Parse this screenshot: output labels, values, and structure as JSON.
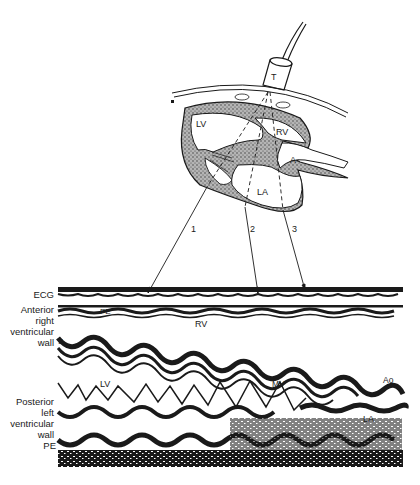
{
  "figure": {
    "type": "echocardiogram-sweep-illustration",
    "diagram": {
      "transducer_label": "T",
      "chambers": {
        "lv": "LV",
        "rv": "RV",
        "la": "LA",
        "aorta": "A"
      },
      "beam_numbers": [
        "1",
        "2",
        "3"
      ]
    },
    "mmode": {
      "left_labels": {
        "ecg": "ECG",
        "anterior_rv_wall": [
          "Anterior",
          "right",
          "ventricular",
          "wall"
        ],
        "posterior_lv_wall": [
          "Posterior",
          "left",
          "ventricular",
          "wall"
        ],
        "pe": "PE"
      },
      "inline_labels": {
        "pe_top": "PE",
        "rv": "RV",
        "s": "S",
        "lv": "LV",
        "mv": "MV",
        "ao": "Ao",
        "la": "LA"
      }
    },
    "colors": {
      "ink": "#1a1a1a",
      "background": "#ffffff",
      "myocardium_fill": "#8a8a8a"
    }
  }
}
